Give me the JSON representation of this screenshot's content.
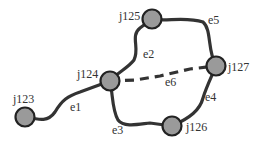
{
  "diagram": {
    "type": "network-graph",
    "nodes": [
      {
        "id": "j123",
        "label": "j123",
        "x": 25,
        "y": 117,
        "lx": 13,
        "ly": 103
      },
      {
        "id": "j124",
        "label": "j124",
        "x": 110,
        "y": 81,
        "lx": 77,
        "ly": 78
      },
      {
        "id": "j125",
        "label": "j125",
        "x": 152,
        "y": 19,
        "lx": 119,
        "ly": 20
      },
      {
        "id": "j126",
        "label": "j126",
        "x": 172,
        "y": 126,
        "lx": 186,
        "ly": 131
      },
      {
        "id": "j127",
        "label": "j127",
        "x": 216,
        "y": 66,
        "lx": 228,
        "ly": 71
      }
    ],
    "edges": [
      {
        "id": "e1",
        "label": "e1",
        "from": "j123",
        "to": "j124",
        "style": "solid",
        "path": "M25,117 C40,120 48,122 55,112 C62,100 68,96 80,92 L110,81",
        "lx": 70,
        "ly": 111
      },
      {
        "id": "e2",
        "label": "e2",
        "from": "j124",
        "to": "j125",
        "style": "solid",
        "path": "M110,81 C118,72 128,68 134,60 C140,48 130,36 140,28 L152,19",
        "lx": 143,
        "ly": 58
      },
      {
        "id": "e3",
        "label": "e3",
        "from": "j124",
        "to": "j126",
        "style": "solid",
        "path": "M110,81 C113,95 112,110 118,120 C124,128 140,124 150,123 L172,126",
        "lx": 112,
        "ly": 134
      },
      {
        "id": "e4",
        "label": "e4",
        "from": "j127",
        "to": "j126",
        "style": "solid",
        "path": "M216,66 C210,80 206,88 203,98 C200,110 190,118 172,126",
        "lx": 205,
        "ly": 101
      },
      {
        "id": "e5",
        "label": "e5",
        "from": "j125",
        "to": "j127",
        "style": "solid",
        "path": "M152,19 C165,22 185,16 203,22 C212,30 207,50 216,66",
        "lx": 208,
        "ly": 24
      },
      {
        "id": "e6",
        "label": "e6",
        "from": "j124",
        "to": "j127",
        "style": "dashed",
        "path": "M110,81 L135,80 L160,76 L190,69 L216,66",
        "lx": 165,
        "ly": 86
      }
    ]
  }
}
